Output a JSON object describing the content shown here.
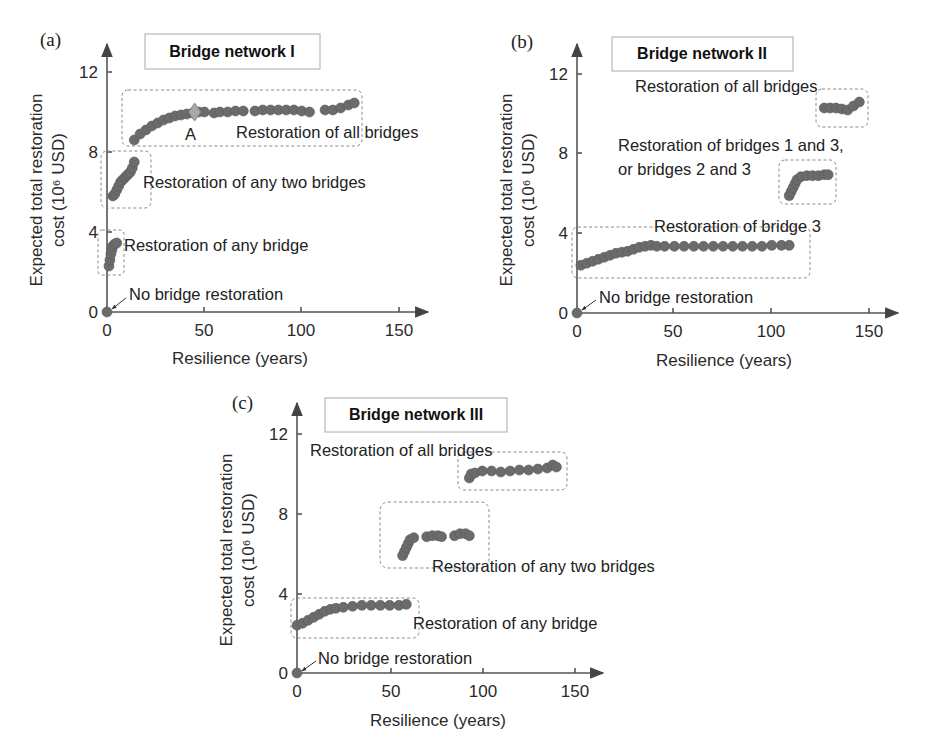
{
  "figure": {
    "panels": [
      {
        "id": "a",
        "panel_label": "(a)",
        "title": "Bridge network I",
        "ylabel_line1": "Expected total restoration",
        "ylabel_line2": "cost (10⁶ USD)",
        "xlabel": "Resilience (years)",
        "x_ticks": [
          "0",
          "50",
          "100",
          "150"
        ],
        "y_ticks": [
          "0",
          "4",
          "8",
          "12"
        ],
        "annotations": {
          "none": "No bridge restoration",
          "one": "Restoration of any bridge",
          "two": "Restoration of any two bridges",
          "all": "Restoration of all bridges",
          "point_a": "A"
        }
      },
      {
        "id": "b",
        "panel_label": "(b)",
        "title": "Bridge network II",
        "ylabel_line1": "Expected total restoration",
        "ylabel_line2": "cost (10⁶ USD)",
        "xlabel": "Resilience (years)",
        "x_ticks": [
          "0",
          "50",
          "100",
          "150"
        ],
        "y_ticks": [
          "0",
          "4",
          "8",
          "12"
        ],
        "annotations": {
          "none": "No bridge restoration",
          "one": "Restoration of bridge 3",
          "two_line1": "Restoration of bridges 1 and 3,",
          "two_line2": "or bridges 2 and 3",
          "all": "Restoration of all bridges"
        }
      },
      {
        "id": "c",
        "panel_label": "(c)",
        "title": "Bridge network III",
        "ylabel_line1": "Expected total restoration",
        "ylabel_line2": "cost (10⁶ USD)",
        "xlabel": "Resilience (years)",
        "x_ticks": [
          "0",
          "50",
          "100",
          "150"
        ],
        "y_ticks": [
          "0",
          "4",
          "8",
          "12"
        ],
        "annotations": {
          "none": "No bridge restoration",
          "one": "Restoration of any bridge",
          "two": "Restoration of any two bridges",
          "all": "Restoration of all bridges"
        }
      }
    ]
  },
  "chart_data": [
    {
      "type": "scatter",
      "title": "Bridge network I",
      "panel": "(a)",
      "xlabel": "Resilience (years)",
      "ylabel": "Expected total restoration cost (10^6 USD)",
      "xlim": [
        0,
        150
      ],
      "ylim": [
        0,
        12
      ],
      "x_ticks": [
        0,
        50,
        100,
        150
      ],
      "y_ticks": [
        0,
        4,
        8,
        12
      ],
      "grid": false,
      "legend": "none",
      "series": [
        {
          "name": "No bridge restoration",
          "x": [
            0
          ],
          "y": [
            0
          ]
        },
        {
          "name": "Restoration of any bridge",
          "x": [
            1,
            1.5,
            2,
            2.5,
            3,
            4,
            5
          ],
          "y": [
            2.3,
            2.6,
            2.9,
            3.1,
            3.3,
            3.4,
            3.45
          ]
        },
        {
          "name": "Restoration of any two bridges",
          "x": [
            3,
            4,
            5,
            6,
            7,
            8,
            9,
            10,
            11,
            12,
            13,
            14
          ],
          "y": [
            5.8,
            5.9,
            6.1,
            6.3,
            6.5,
            6.6,
            6.7,
            6.8,
            6.9,
            7.0,
            7.2,
            7.5
          ]
        },
        {
          "name": "Restoration of all bridges",
          "x": [
            14,
            17,
            20,
            23,
            26,
            29,
            32,
            35,
            38,
            41,
            44,
            47,
            50,
            55,
            58,
            62,
            66,
            70,
            76,
            80,
            84,
            88,
            92,
            96,
            100,
            104,
            112,
            116,
            120,
            124,
            127
          ],
          "y": [
            8.6,
            8.9,
            9.1,
            9.3,
            9.45,
            9.6,
            9.7,
            9.8,
            9.85,
            9.9,
            9.95,
            10.0,
            10.0,
            9.95,
            10.0,
            10.0,
            10.05,
            10.05,
            10.05,
            10.1,
            10.1,
            10.1,
            10.1,
            10.1,
            10.05,
            10.0,
            10.1,
            10.1,
            10.2,
            10.35,
            10.45
          ]
        },
        {
          "name": "A",
          "marker": "diamond",
          "x": [
            45
          ],
          "y": [
            10.0
          ]
        }
      ]
    },
    {
      "type": "scatter",
      "title": "Bridge network II",
      "panel": "(b)",
      "xlabel": "Resilience (years)",
      "ylabel": "Expected total restoration cost (10^6 USD)",
      "xlim": [
        0,
        150
      ],
      "ylim": [
        0,
        12
      ],
      "x_ticks": [
        0,
        50,
        100,
        150
      ],
      "y_ticks": [
        0,
        4,
        8,
        12
      ],
      "grid": false,
      "legend": "none",
      "series": [
        {
          "name": "No bridge restoration",
          "x": [
            0
          ],
          "y": [
            0
          ]
        },
        {
          "name": "Restoration of bridge 3",
          "x": [
            2,
            5,
            8,
            11,
            14,
            17,
            20,
            23,
            26,
            29,
            32,
            35,
            38,
            41,
            45,
            50,
            55,
            60,
            65,
            70,
            75,
            80,
            85,
            90,
            95,
            100,
            105,
            109
          ],
          "y": [
            2.4,
            2.5,
            2.6,
            2.7,
            2.8,
            2.9,
            3.0,
            3.05,
            3.1,
            3.2,
            3.3,
            3.35,
            3.4,
            3.35,
            3.35,
            3.35,
            3.35,
            3.35,
            3.35,
            3.35,
            3.35,
            3.35,
            3.35,
            3.35,
            3.35,
            3.4,
            3.4,
            3.4
          ]
        },
        {
          "name": "Restoration of bridges 1 and 3, or bridges 2 and 3",
          "x": [
            109,
            110,
            111,
            112,
            113,
            115,
            118,
            121,
            124,
            127,
            129
          ],
          "y": [
            5.9,
            6.1,
            6.3,
            6.5,
            6.7,
            6.85,
            6.9,
            6.9,
            6.9,
            6.95,
            6.95
          ]
        },
        {
          "name": "Restoration of all bridges",
          "x": [
            127,
            130,
            133,
            136,
            139,
            142,
            145
          ],
          "y": [
            10.3,
            10.3,
            10.3,
            10.25,
            10.2,
            10.4,
            10.6
          ]
        }
      ]
    },
    {
      "type": "scatter",
      "title": "Bridge network III",
      "panel": "(c)",
      "xlabel": "Resilience (years)",
      "ylabel": "Expected total restoration cost (10^6 USD)",
      "xlim": [
        0,
        150
      ],
      "ylim": [
        0,
        12
      ],
      "x_ticks": [
        0,
        50,
        100,
        150
      ],
      "y_ticks": [
        0,
        4,
        8,
        12
      ],
      "grid": false,
      "legend": "none",
      "series": [
        {
          "name": "No bridge restoration",
          "x": [
            0
          ],
          "y": [
            0
          ]
        },
        {
          "name": "Restoration of any bridge",
          "x": [
            0,
            3,
            6,
            9,
            12,
            15,
            18,
            21,
            25,
            30,
            35,
            40,
            45,
            50,
            55,
            59
          ],
          "y": [
            2.4,
            2.5,
            2.65,
            2.8,
            2.95,
            3.1,
            3.2,
            3.25,
            3.3,
            3.35,
            3.4,
            3.4,
            3.4,
            3.4,
            3.4,
            3.45
          ]
        },
        {
          "name": "Restoration of any two bridges",
          "x": [
            57,
            58,
            59,
            60,
            61,
            63,
            70,
            73,
            76,
            78,
            85,
            88,
            91,
            93
          ],
          "y": [
            5.9,
            6.1,
            6.3,
            6.5,
            6.7,
            6.8,
            6.85,
            6.9,
            6.9,
            6.85,
            6.9,
            7.0,
            7.0,
            6.9
          ]
        },
        {
          "name": "Restoration of all bridges",
          "x": [
            93,
            94,
            96,
            100,
            105,
            110,
            115,
            120,
            125,
            130,
            135,
            138,
            140
          ],
          "y": [
            9.8,
            10.0,
            10.05,
            10.15,
            10.15,
            10.1,
            10.15,
            10.2,
            10.2,
            10.25,
            10.3,
            10.45,
            10.35
          ]
        }
      ]
    }
  ]
}
